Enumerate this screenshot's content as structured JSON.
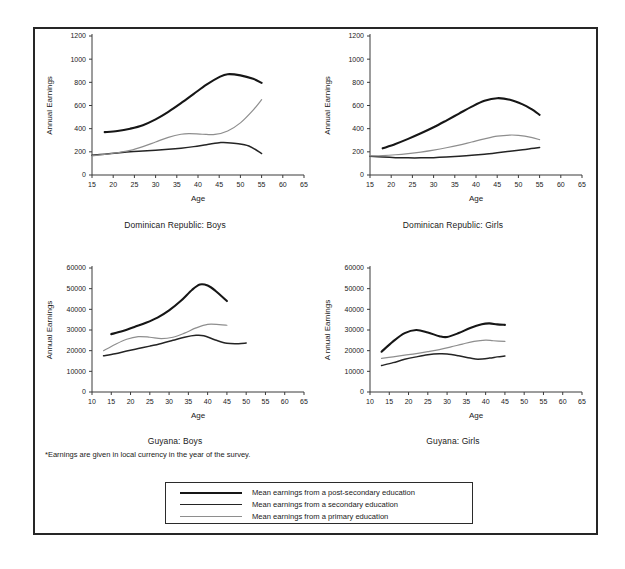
{
  "figure": {
    "footnote": "*Earnings are given in local currency in the year of the survey.",
    "legend": {
      "items": [
        {
          "label": "Mean earnings from a post-secondary education",
          "key": "post",
          "color": "#161616"
        },
        {
          "label": "Mean earnings from a secondary education",
          "key": "secondary",
          "color": "#242424"
        },
        {
          "label": "Mean earnings from a primary education",
          "key": "primary",
          "color": "#8e8e8e"
        }
      ]
    }
  },
  "chart_data": [
    {
      "type": "line",
      "title": "Dominican Republic: Boys",
      "xlabel": "Age",
      "ylabel": "Annual Earnings",
      "xlim": [
        15,
        65
      ],
      "ylim": [
        0,
        1200
      ],
      "xticks": [
        15,
        20,
        25,
        30,
        35,
        40,
        45,
        50,
        55,
        60,
        65
      ],
      "yticks": [
        0,
        200,
        400,
        600,
        800,
        1000,
        1200
      ],
      "grid": false,
      "legend_position": "figure-bottom",
      "series": [
        {
          "name": "Mean earnings from a post-secondary education",
          "x": [
            18,
            21,
            24,
            27,
            30,
            33,
            36,
            39,
            42,
            45,
            47,
            50,
            53,
            55
          ],
          "values": [
            370,
            380,
            400,
            430,
            480,
            545,
            620,
            700,
            780,
            845,
            870,
            860,
            830,
            795
          ]
        },
        {
          "name": "Mean earnings from a secondary education",
          "x": [
            15,
            18,
            21,
            24,
            27,
            30,
            33,
            36,
            39,
            42,
            45,
            46,
            49,
            52,
            55
          ],
          "values": [
            170,
            180,
            190,
            200,
            207,
            214,
            222,
            232,
            245,
            262,
            278,
            280,
            272,
            250,
            185
          ]
        },
        {
          "name": "Mean earnings from a primary education",
          "x": [
            15,
            18,
            21,
            24,
            27,
            30,
            33,
            36,
            38,
            41,
            44,
            47,
            50,
            53,
            55
          ],
          "values": [
            165,
            178,
            192,
            212,
            245,
            285,
            325,
            352,
            357,
            352,
            350,
            380,
            450,
            560,
            650
          ]
        }
      ]
    },
    {
      "type": "line",
      "title": "Dominican Republic: Girls",
      "xlabel": "Age",
      "ylabel": "Annual Earnings",
      "xlim": [
        15,
        65
      ],
      "ylim": [
        0,
        1200
      ],
      "xticks": [
        15,
        20,
        25,
        30,
        35,
        40,
        45,
        50,
        55,
        60,
        65
      ],
      "yticks": [
        0,
        200,
        400,
        600,
        800,
        1000,
        1200
      ],
      "grid": false,
      "legend_position": "figure-bottom",
      "series": [
        {
          "name": "Mean earnings from a post-secondary education",
          "x": [
            18,
            21,
            24,
            27,
            30,
            33,
            36,
            39,
            42,
            45,
            48,
            51,
            53,
            55
          ],
          "values": [
            230,
            268,
            312,
            360,
            412,
            470,
            530,
            590,
            640,
            663,
            650,
            610,
            570,
            520
          ]
        },
        {
          "name": "Mean earnings from a secondary education",
          "x": [
            15,
            18,
            21,
            24,
            27,
            30,
            33,
            36,
            39,
            42,
            45,
            48,
            51,
            53,
            55
          ],
          "values": [
            162,
            155,
            150,
            148,
            148,
            150,
            155,
            162,
            170,
            180,
            192,
            205,
            218,
            228,
            238
          ]
        },
        {
          "name": "Mean earnings from a primary education",
          "x": [
            15,
            18,
            21,
            24,
            27,
            30,
            33,
            36,
            39,
            42,
            45,
            48,
            50,
            53,
            55
          ],
          "values": [
            165,
            168,
            175,
            185,
            198,
            215,
            235,
            258,
            285,
            312,
            335,
            345,
            342,
            325,
            305
          ]
        }
      ]
    },
    {
      "type": "line",
      "title": "Guyana: Boys",
      "xlabel": "Age",
      "ylabel": "Annual Earnings",
      "xlim": [
        10,
        65
      ],
      "ylim": [
        0,
        60000
      ],
      "xticks": [
        10,
        15,
        20,
        25,
        30,
        35,
        40,
        45,
        50,
        55,
        60,
        65
      ],
      "yticks": [
        0,
        10000,
        20000,
        30000,
        40000,
        50000,
        60000
      ],
      "grid": false,
      "legend_position": "figure-bottom",
      "series": [
        {
          "name": "Mean earnings from a post-secondary education",
          "x": [
            15,
            18,
            21,
            24,
            27,
            30,
            33,
            36,
            38,
            40,
            42,
            45
          ],
          "values": [
            28000,
            29500,
            31500,
            33500,
            36000,
            39500,
            44000,
            49500,
            52000,
            51500,
            49000,
            44000
          ]
        },
        {
          "name": "Mean earnings from a secondary education",
          "x": [
            13,
            16,
            19,
            22,
            25,
            28,
            31,
            34,
            37,
            39,
            42,
            45,
            48,
            50
          ],
          "values": [
            17500,
            18500,
            19800,
            21000,
            22200,
            23500,
            25000,
            26500,
            27400,
            27200,
            25200,
            23600,
            23400,
            23700
          ]
        },
        {
          "name": "Mean earnings from a primary education",
          "x": [
            13,
            16,
            19,
            22,
            25,
            28,
            31,
            34,
            37,
            40,
            43,
            45
          ],
          "values": [
            20000,
            23000,
            25500,
            26800,
            26500,
            25800,
            26500,
            28500,
            31000,
            32700,
            32600,
            32300
          ]
        }
      ]
    },
    {
      "type": "line",
      "title": "Guyana: Girls",
      "xlabel": "Age",
      "ylabel": "A nnual Earnings",
      "xlim": [
        10,
        65
      ],
      "ylim": [
        0,
        60000
      ],
      "xticks": [
        10,
        15,
        20,
        25,
        30,
        35,
        40,
        45,
        50,
        55,
        60,
        65
      ],
      "yticks": [
        0,
        10000,
        20000,
        30000,
        40000,
        50000,
        60000
      ],
      "grid": false,
      "legend_position": "figure-bottom",
      "series": [
        {
          "name": "Mean earnings from a post-secondary education",
          "x": [
            13,
            16,
            19,
            22,
            25,
            28,
            30,
            33,
            36,
            39,
            41,
            43,
            45
          ],
          "values": [
            19500,
            24500,
            28500,
            30000,
            28800,
            27000,
            26600,
            28500,
            31000,
            32800,
            33200,
            32700,
            32500
          ]
        },
        {
          "name": "Mean earnings from a secondary education",
          "x": [
            13,
            16,
            19,
            22,
            25,
            28,
            30,
            33,
            36,
            38,
            41,
            43,
            45
          ],
          "values": [
            12800,
            14200,
            15800,
            17000,
            18000,
            18500,
            18400,
            17500,
            16400,
            15900,
            16400,
            17000,
            17400
          ]
        },
        {
          "name": "Mean earnings from a primary education",
          "x": [
            13,
            16,
            19,
            22,
            25,
            28,
            31,
            34,
            37,
            40,
            42,
            45
          ],
          "values": [
            16300,
            17000,
            17800,
            18600,
            19500,
            20500,
            21800,
            23200,
            24500,
            25100,
            24800,
            24500
          ]
        }
      ]
    }
  ]
}
